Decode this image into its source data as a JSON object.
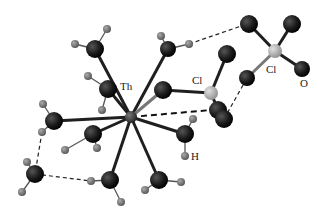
{
  "diagram": {
    "type": "molecular-structure",
    "labels": {
      "th": "Th",
      "cl_inner": "Cl",
      "cl_outer": "Cl",
      "o": "O",
      "h": "H"
    },
    "colors": {
      "oxygen": "#1a1a1a",
      "hydrogen": "#7a7a7a",
      "chlorine": "#b5b5b5",
      "thorium": "#3a3a3a",
      "bond": "#1f1f1f"
    },
    "atoms": [
      {
        "id": "Th",
        "el": "Th",
        "x": 131,
        "y": 117
      },
      {
        "id": "O1",
        "el": "O",
        "x": 95,
        "y": 49
      },
      {
        "id": "O2",
        "el": "O",
        "x": 108,
        "y": 89
      },
      {
        "id": "O3",
        "el": "O",
        "x": 168,
        "y": 49
      },
      {
        "id": "O4",
        "el": "O",
        "x": 163,
        "y": 90
      },
      {
        "id": "O5",
        "el": "O",
        "x": 54,
        "y": 121
      },
      {
        "id": "O6",
        "el": "O",
        "x": 93,
        "y": 134
      },
      {
        "id": "O7",
        "el": "O",
        "x": 110,
        "y": 180
      },
      {
        "id": "O8",
        "el": "O",
        "x": 159,
        "y": 180
      },
      {
        "id": "O9",
        "el": "O",
        "x": 185,
        "y": 134
      },
      {
        "id": "Cl1",
        "el": "Cl",
        "x": 211,
        "y": 93
      },
      {
        "id": "O10",
        "el": "O",
        "x": 227,
        "y": 54
      },
      {
        "id": "O11",
        "el": "O",
        "x": 218,
        "y": 110
      },
      {
        "id": "O12",
        "el": "O",
        "x": 224,
        "y": 119
      },
      {
        "id": "Cl2",
        "el": "Cl",
        "x": 275,
        "y": 51
      },
      {
        "id": "O13",
        "el": "O",
        "x": 249,
        "y": 24
      },
      {
        "id": "O14",
        "el": "O",
        "x": 292,
        "y": 24
      },
      {
        "id": "O15",
        "el": "O",
        "x": 302,
        "y": 69
      },
      {
        "id": "O16",
        "el": "O",
        "x": 247,
        "y": 78
      },
      {
        "id": "O17",
        "el": "O",
        "x": 35,
        "y": 174
      }
    ]
  }
}
